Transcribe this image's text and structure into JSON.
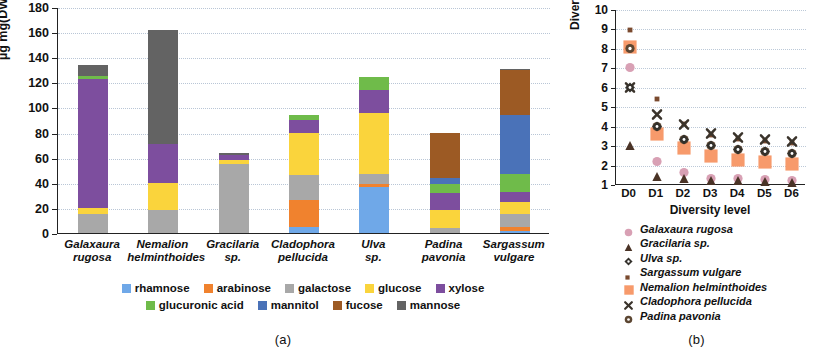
{
  "figure": {
    "panel_a_caption": "(a)",
    "panel_b_caption": "(b)"
  },
  "panel_a": {
    "y_axis_label": "µg mg(DW)",
    "y_axis_label_sup": "-1",
    "y_ticks": [
      "0",
      "20",
      "40",
      "60",
      "80",
      "100",
      "120",
      "140",
      "160",
      "180"
    ],
    "categories": [
      {
        "line1": "Galaxaura",
        "line2": "rugosa"
      },
      {
        "line1": "Nemalion",
        "line2": "helminthoides"
      },
      {
        "line1": "Gracilaria",
        "line2": "sp."
      },
      {
        "line1": "Cladophora",
        "line2": "pellucida"
      },
      {
        "line1": "Ulva",
        "line2": "sp."
      },
      {
        "line1": "Padina",
        "line2": "pavonia"
      },
      {
        "line1": "Sargassum",
        "line2": "vulgare"
      }
    ],
    "legend_row1": [
      {
        "label": "rhamnose",
        "color": "#6FA8E8"
      },
      {
        "label": "arabinose",
        "color": "#F0822E"
      },
      {
        "label": "galactose",
        "color": "#A8A8A8"
      },
      {
        "label": "glucose",
        "color": "#FAD43C"
      },
      {
        "label": "xylose",
        "color": "#7D4E9E"
      }
    ],
    "legend_row2": [
      {
        "label": "glucuronic acid",
        "color": "#6FBB4A"
      },
      {
        "label": "mannitol",
        "color": "#4A72B8"
      },
      {
        "label": "fucose",
        "color": "#9C5A24"
      },
      {
        "label": "mannose",
        "color": "#636363"
      }
    ]
  },
  "panel_b": {
    "y_axis_label": "Diversity score",
    "x_axis_label": "Diversity level",
    "y_ticks": [
      "1",
      "2",
      "3",
      "4",
      "5",
      "6",
      "7",
      "8",
      "9",
      "10"
    ],
    "x_ticks": [
      "D0",
      "D1",
      "D2",
      "D3",
      "D4",
      "D5",
      "D6"
    ],
    "legend": [
      {
        "label": "Galaxaura rugosa",
        "marker": "circle",
        "color": "#D8A0B4"
      },
      {
        "label": "Gracilaria sp.",
        "marker": "triangle",
        "color": "#4A3326"
      },
      {
        "label": "Ulva sp.",
        "marker": "diamond",
        "color": "#33302B"
      },
      {
        "label": "Sargassum vulgare",
        "marker": "square-small",
        "color": "#7A4A2E"
      },
      {
        "label": "Nemalion helminthoides",
        "marker": "square-large",
        "color": "#F79A6B"
      },
      {
        "label": "Cladophora pellucida",
        "marker": "x-bold",
        "color": "#3A332B"
      },
      {
        "label": "Padina pavonia",
        "marker": "circle-dot",
        "color": "#5C4632"
      }
    ]
  },
  "chart_data": [
    {
      "type": "bar",
      "panel": "(a)",
      "stacked": true,
      "title": "",
      "xlabel": "",
      "ylabel": "µg mg(DW)-1",
      "ylim": [
        0,
        180
      ],
      "ytick_step": 20,
      "grid": true,
      "legend_position": "bottom",
      "categories": [
        "Galaxaura rugosa",
        "Nemalion helminthoides",
        "Gracilaria sp.",
        "Cladophora pellucida",
        "Ulva sp.",
        "Padina pavonia",
        "Sargassum vulgare"
      ],
      "series": [
        {
          "name": "rhamnose",
          "color": "#6FA8E8",
          "values": [
            0,
            0,
            0,
            5,
            37,
            0,
            2
          ]
        },
        {
          "name": "arabinose",
          "color": "#F0822E",
          "values": [
            0,
            0,
            0,
            21,
            2,
            0,
            3
          ]
        },
        {
          "name": "galactose",
          "color": "#A8A8A8",
          "values": [
            15,
            18,
            55,
            20,
            8,
            4,
            10
          ]
        },
        {
          "name": "glucose",
          "color": "#FAD43C",
          "values": [
            5,
            22,
            3,
            34,
            49,
            14,
            10
          ]
        },
        {
          "name": "xylose",
          "color": "#7D4E9E",
          "values": [
            103,
            31,
            4,
            10,
            18,
            14,
            8
          ]
        },
        {
          "name": "glucuronic acid",
          "color": "#6FBB4A",
          "values": [
            2,
            0,
            0,
            4,
            10,
            7,
            14
          ]
        },
        {
          "name": "mannitol",
          "color": "#4A72B8",
          "values": [
            0,
            0,
            0,
            0,
            0,
            5,
            47
          ]
        },
        {
          "name": "fucose",
          "color": "#9C5A24",
          "values": [
            0,
            0,
            0,
            0,
            0,
            36,
            36
          ]
        },
        {
          "name": "mannose",
          "color": "#636363",
          "values": [
            9,
            91,
            2,
            0,
            0,
            0,
            1
          ]
        }
      ],
      "totals": [
        134,
        162,
        64,
        94,
        124,
        80,
        131
      ]
    },
    {
      "type": "scatter",
      "panel": "(b)",
      "title": "",
      "xlabel": "Diversity level",
      "ylabel": "Diversity score",
      "ylim": [
        1,
        10
      ],
      "ytick_step": 1,
      "grid": true,
      "legend_position": "bottom",
      "x": [
        "D0",
        "D1",
        "D2",
        "D3",
        "D4",
        "D5",
        "D6"
      ],
      "series": [
        {
          "name": "Galaxaura rugosa",
          "marker": "circle",
          "color": "#D8A0B4",
          "values": [
            7,
            2.2,
            1.6,
            1.3,
            1.3,
            1.25,
            1.2
          ]
        },
        {
          "name": "Gracilaria sp.",
          "marker": "triangle",
          "color": "#4A3326",
          "values": [
            3,
            1.4,
            1.3,
            1.2,
            1.2,
            1.15,
            1.1
          ]
        },
        {
          "name": "Ulva sp.",
          "marker": "diamond",
          "color": "#33302B",
          "values": [
            6,
            4.0,
            3.3,
            3.0,
            2.8,
            2.7,
            2.6
          ]
        },
        {
          "name": "Sargassum vulgare",
          "marker": "square-small",
          "color": "#7A4A2E",
          "values": [
            9,
            5.5,
            4.2,
            3.6,
            3.4,
            3.3,
            3.2
          ]
        },
        {
          "name": "Nemalion helminthoides",
          "marker": "square-large",
          "color": "#F79A6B",
          "values": [
            8,
            3.5,
            2.8,
            2.4,
            2.2,
            2.1,
            2.0
          ]
        },
        {
          "name": "Cladophora pellucida",
          "marker": "x-bold",
          "color": "#3A332B",
          "values": [
            6,
            4.6,
            4.1,
            3.6,
            3.4,
            3.3,
            3.2
          ]
        },
        {
          "name": "Padina pavonia",
          "marker": "circle-dot",
          "color": "#5C4632",
          "values": [
            8,
            4.0,
            3.3,
            3.0,
            2.8,
            2.7,
            2.6
          ]
        }
      ]
    }
  ]
}
